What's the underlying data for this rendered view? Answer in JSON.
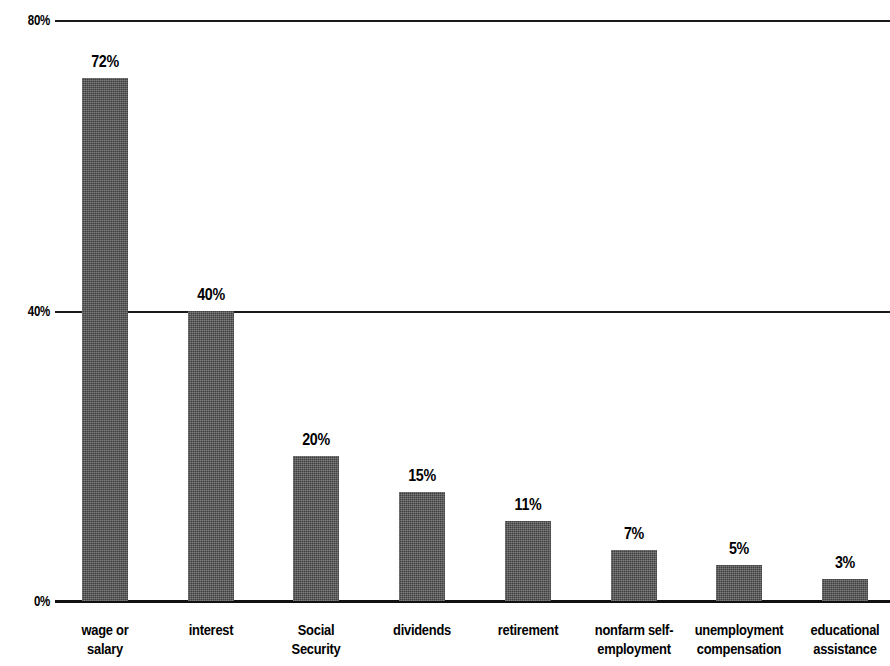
{
  "chart_data": {
    "type": "bar",
    "title": "",
    "subtitle": "",
    "xlabel": "",
    "ylabel": "",
    "ylim": [
      0,
      80
    ],
    "y_unit": "%",
    "grid": true,
    "legend": null,
    "orientation": "vertical",
    "bar_color": "#4f4f4f",
    "axis_color": "#111111",
    "background_color": "#ffffff",
    "y_ticks": [
      "0%",
      "40%",
      "80%"
    ],
    "y_tick_values": [
      0,
      40,
      80
    ],
    "categories": [
      "wage or\nsalary",
      "interest",
      "Social\nSecurity",
      "dividends",
      "retirement",
      "nonfarm self-\nemployment",
      "unemployment\ncompensation",
      "educational\nassistance"
    ],
    "values": [
      72,
      40,
      20,
      15,
      11,
      7,
      5,
      3
    ],
    "data_labels": [
      "72%",
      "40%",
      "20%",
      "15%",
      "11%",
      "7%",
      "5%",
      "3%"
    ]
  }
}
